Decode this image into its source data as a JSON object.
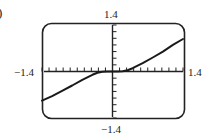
{
  "figure": {
    "part_label": ")",
    "window": {
      "ymax_label": "1.4",
      "ymin_label": "−1.4",
      "xmin_label": "−1.4",
      "xmax_label": "1.4"
    }
  },
  "chart_data": {
    "type": "line",
    "title": "",
    "xlabel": "",
    "ylabel": "",
    "xlim": [
      -1.4,
      1.4
    ],
    "ylim": [
      -1.4,
      1.4
    ],
    "grid": false,
    "legend": null,
    "axes_style": "graphing-calculator viewing window with tick marks, rounded frame",
    "x_tick_spacing": 0.14,
    "y_tick_spacing": 0.2,
    "tick_labels": {
      "x": [
        "−1.4",
        "1.4"
      ],
      "y": [
        "−1.4",
        "1.4"
      ]
    },
    "series": [
      {
        "name": "f(x)",
        "x": [
          -1.4,
          -1.2,
          -1.0,
          -0.8,
          -0.6,
          -0.4,
          -0.3,
          -0.2,
          -0.1,
          0.0,
          0.1,
          0.2,
          0.3,
          0.4,
          0.6,
          0.8,
          1.0,
          1.2,
          1.4
        ],
        "y": [
          -0.88,
          -0.74,
          -0.58,
          -0.42,
          -0.25,
          -0.1,
          -0.04,
          -0.01,
          0.0,
          0.0,
          0.0,
          0.01,
          0.04,
          0.1,
          0.25,
          0.42,
          0.6,
          0.8,
          0.98
        ]
      }
    ],
    "annotations": [
      ")"
    ]
  }
}
